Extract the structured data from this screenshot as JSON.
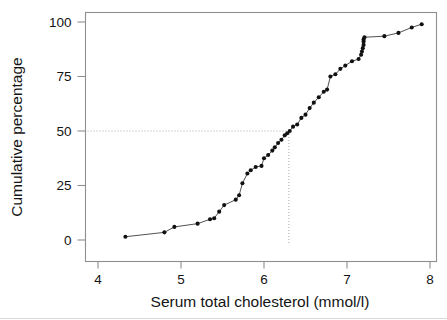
{
  "chart_data": {
    "type": "line",
    "title": "",
    "subtitle": "",
    "xlabel": "Serum total cholesterol (mmol/l)",
    "ylabel": "Cumulative percentage",
    "xlim": [
      3.75,
      8.1
    ],
    "ylim": [
      -3,
      102
    ],
    "xticks": [
      4,
      5,
      6,
      7,
      8
    ],
    "xtick_labels": [
      "4",
      "5",
      "6",
      "7",
      "8"
    ],
    "yticks": [
      0,
      25,
      50,
      75,
      100
    ],
    "ytick_labels": [
      "0",
      "25",
      "50",
      "75",
      "100"
    ],
    "grid": false,
    "legend": false,
    "legend_position": "none",
    "marker": "filled-circle",
    "series": [
      {
        "name": "Cumulative percentage",
        "x": [
          4.33,
          4.8,
          4.92,
          5.2,
          5.35,
          5.4,
          5.46,
          5.52,
          5.66,
          5.7,
          5.74,
          5.8,
          5.84,
          5.9,
          5.97,
          6.0,
          6.05,
          6.1,
          6.13,
          6.17,
          6.21,
          6.25,
          6.28,
          6.31,
          6.35,
          6.4,
          6.45,
          6.5,
          6.55,
          6.6,
          6.66,
          6.72,
          6.76,
          6.8,
          6.86,
          6.92,
          6.98,
          7.06,
          7.14,
          7.17,
          7.18,
          7.19,
          7.2,
          7.2,
          7.2,
          7.21,
          7.45,
          7.62,
          7.78,
          7.9
        ],
        "y": [
          1.5,
          3.5,
          6.0,
          7.5,
          9.5,
          10.0,
          13.0,
          16.0,
          18.5,
          20.5,
          26.0,
          30.5,
          32.0,
          33.5,
          34.0,
          37.5,
          39.0,
          41.0,
          42.5,
          44.5,
          46.0,
          48.0,
          49.0,
          50.0,
          52.0,
          53.0,
          56.0,
          57.5,
          60.5,
          63.0,
          65.5,
          68.0,
          69.0,
          75.0,
          76.0,
          78.5,
          80.0,
          82.0,
          83.0,
          85.0,
          86.5,
          88.0,
          89.5,
          91.0,
          92.0,
          93.0,
          93.5,
          95.0,
          97.5,
          99.0
        ]
      }
    ],
    "annotations": [
      {
        "name": "median-reference",
        "type": "crosshair",
        "y_value": 50,
        "x_value": 6.3,
        "style": "dotted"
      }
    ]
  }
}
